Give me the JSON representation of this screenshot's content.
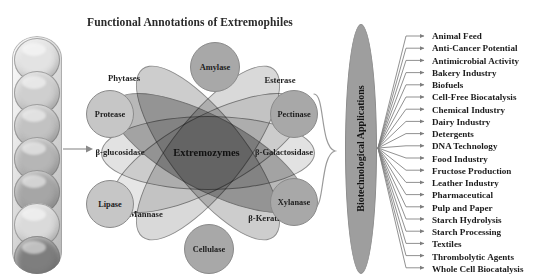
{
  "figure": {
    "title": "Functional Annotations of Extremophiles",
    "width": 555,
    "height": 279,
    "background": "#ffffff"
  },
  "sample_photo": {
    "name": "extremophile-sample-photo",
    "description": "stacked sample dishes",
    "dish_count": 7,
    "dish_shades": [
      "#e3e3e3",
      "#cfcfcf",
      "#c2c2c2",
      "#b6b6b6",
      "#a6a6a6",
      "#dadada",
      "#7e7e7e"
    ]
  },
  "venn": {
    "core_label": "Extremozymes",
    "petals": [
      {
        "label": "Phytases",
        "fill": "#d9d9d9",
        "rotate": -52,
        "label_x": 40,
        "label_y": 50
      },
      {
        "label": "Esterase",
        "fill": "#cdcdcd",
        "rotate": 52,
        "label_x": 196,
        "label_y": 52
      },
      {
        "label": "β-glucosidase",
        "fill": "#e2e2e2",
        "rotate": 0,
        "label_x": 32,
        "label_y": 124
      },
      {
        "label": "β-Galactosidase",
        "fill": "#b8b8b8",
        "rotate": 0,
        "label_x": 200,
        "label_y": 124
      },
      {
        "label": "Mannase",
        "fill": "#e6e6e6",
        "rotate": -28,
        "label_x": 60,
        "label_y": 186
      },
      {
        "label": "β-Keratinase",
        "fill": "#b8b8b8",
        "rotate": 28,
        "label_x": 185,
        "label_y": 190
      }
    ]
  },
  "enzyme_circles": [
    {
      "label": "Amylase",
      "x": 106,
      "y": 14,
      "d": 48,
      "tone": "dark"
    },
    {
      "label": "Protease",
      "x": 6,
      "y": 62,
      "d": 46,
      "tone": "light"
    },
    {
      "label": "Pectinase",
      "x": 182,
      "y": 62,
      "d": 46,
      "tone": "dark"
    },
    {
      "label": "Lipase",
      "x": 6,
      "y": 152,
      "d": 46,
      "tone": "light"
    },
    {
      "label": "Xylanase",
      "x": 182,
      "y": 150,
      "d": 46,
      "tone": "dark"
    },
    {
      "label": "Cellulase",
      "x": 100,
      "y": 196,
      "d": 48,
      "tone": "dark"
    }
  ],
  "applications_ellipse": {
    "label": "Biotechnological Applications",
    "fill": "#9e9e9e"
  },
  "applications": [
    "Animal Feed",
    "Anti-Cancer Potential",
    "Antimicrobial Activity",
    "Bakery Industry",
    "Biofuels",
    "Cell-Free Biocatalysis",
    "Chemical Industry",
    "Dairy Industry",
    "Detergents",
    "DNA Technology",
    "Food Industry",
    "Fructose Production",
    "Leather Industry",
    "Pharmaceutical",
    "Pulp and Paper",
    "Starch Hydrolysis",
    "Starch Processing",
    "Textiles",
    "Thrombolytic Agents",
    "Whole Cell Biocatalysis"
  ],
  "colors": {
    "text": "#1b1b1b",
    "stroke": "#6f6f6f",
    "petal_light": "#e6e6e6",
    "petal_mid": "#cdcdcd",
    "petal_dark": "#b8b8b8",
    "circle_dark": "#a8a8a8",
    "circle_light": "#c6c6c6",
    "ellipse": "#9e9e9e"
  }
}
